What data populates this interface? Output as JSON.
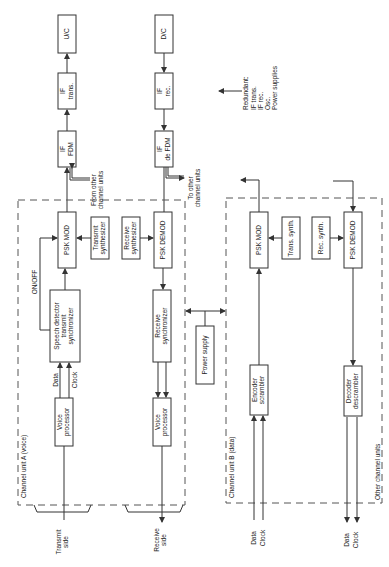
{
  "diagram": {
    "orientation": "rotated-90-ccw",
    "top_chain": {
      "uc": "U/C",
      "if_trans": [
        "IF",
        "trans."
      ],
      "if_fdm": [
        "IF",
        "FDM"
      ],
      "from_other": [
        "From other",
        "channel units"
      ],
      "dc": "D/C",
      "if_rec": [
        "IF",
        "rec."
      ],
      "if_defdm": [
        "IF",
        "de FDM"
      ],
      "to_other_a": [
        "To other",
        "channel units"
      ],
      "to_other_b": [
        "To other",
        "channel units"
      ]
    },
    "redundant": {
      "title": "Redundant:",
      "items": [
        "IF trans.",
        "IF rec.",
        "Osc.",
        "Power supplies"
      ]
    },
    "unit_a": {
      "title": "Channel unit A (voice)",
      "psk_mod": "PSK MOD",
      "tx_synth": [
        "Transmit",
        "synthesizer"
      ],
      "rx_synth": [
        "Receive",
        "synthesizer"
      ],
      "psk_demod": "PSK DEMOD",
      "onoff": "ON/OFF",
      "speech": [
        "Speech detector",
        "transmit",
        "synchronizer"
      ],
      "rx_sync": [
        "Receive",
        "synchronizer"
      ],
      "data": "Data",
      "clock": "Clock",
      "voice_tx": [
        "Voice",
        "processor"
      ],
      "voice_rx": [
        "Voice",
        "processor"
      ],
      "transmit_side": [
        "Transmit",
        "side"
      ],
      "receive_side": [
        "Receive",
        "side"
      ]
    },
    "power_supply": "Power supply",
    "unit_b": {
      "title": "Channel unit B (data)",
      "psk_mod": "PSK MOD",
      "trans_synth": "Trans. synth.",
      "rec_synth": "Rec. synth.",
      "psk_demod": "PSK DEMOD",
      "encoder": [
        "Encoder",
        "scrambler"
      ],
      "decoder": [
        "Decoder",
        "descrambler"
      ],
      "in_data": "Data",
      "in_clock": "Clock",
      "out_data": "Data",
      "out_clock": "Clock"
    },
    "other_units": "Other channel units"
  }
}
